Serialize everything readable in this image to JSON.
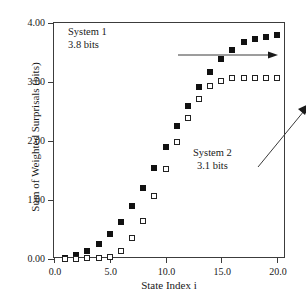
{
  "chart_data": {
    "type": "scatter",
    "title": "",
    "xlabel": "State Index i",
    "ylabel": "Sum of Weighted Surprisals (bits)",
    "xlim": [
      0.0,
      20.8
    ],
    "ylim": [
      0.0,
      4.0
    ],
    "xticks": [
      "0.0",
      "5.0",
      "10.0",
      "15.0",
      "20.0"
    ],
    "xtick_values": [
      0.0,
      5.0,
      10.0,
      15.0,
      20.0
    ],
    "yticks": [
      "0.00",
      "1.00",
      "2.00",
      "3.00",
      "4.00"
    ],
    "ytick_values": [
      0.0,
      1.0,
      2.0,
      3.0,
      4.0
    ],
    "grid": false,
    "legend": "none",
    "x": [
      1,
      2,
      3,
      4,
      5,
      6,
      7,
      8,
      9,
      10,
      11,
      12,
      13,
      14,
      15,
      16,
      17,
      18,
      19,
      20
    ],
    "series": [
      {
        "name": "System 1",
        "marker": "filled-square",
        "color": "#111111",
        "values": [
          0.01,
          0.06,
          0.13,
          0.25,
          0.43,
          0.62,
          0.89,
          1.2,
          1.54,
          1.9,
          2.26,
          2.59,
          2.91,
          3.17,
          3.39,
          3.55,
          3.67,
          3.73,
          3.77,
          3.8
        ]
      },
      {
        "name": "System 2",
        "marker": "open-square",
        "color": "#222222",
        "values": [
          0.0,
          0.0,
          0.01,
          0.01,
          0.03,
          0.14,
          0.36,
          0.65,
          1.06,
          1.53,
          1.98,
          2.39,
          2.71,
          2.94,
          3.02,
          3.06,
          3.07,
          3.07,
          3.07,
          3.07
        ]
      }
    ],
    "annotations": [
      {
        "id": "system-1",
        "line1": "System 1",
        "line2": "3.8 bits",
        "arrow": "horizontal-right",
        "points_to": "System 1 plateau"
      },
      {
        "id": "system-2",
        "line1": "System 2",
        "line2": "3.1 bits",
        "arrow": "diagonal-up-right",
        "points_to": "System 2 plateau"
      }
    ]
  }
}
